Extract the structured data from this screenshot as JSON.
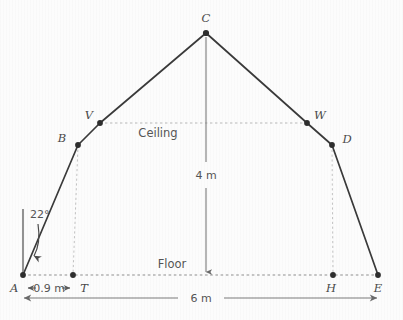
{
  "figure": {
    "background_color": "#fcfcfc",
    "line_color": "#3a3a3a",
    "dotted_color": "#b5b5b5",
    "dimension_color": "#6a6a6a",
    "text_color": "#555555"
  },
  "points": [
    {
      "id": "A",
      "label": "A",
      "x": 23,
      "y": 275,
      "dot": true,
      "label_x": 10,
      "label_y": 292
    },
    {
      "id": "B",
      "label": "B",
      "x": 78,
      "y": 145,
      "dot": true,
      "label_x": 62,
      "label_y": 142
    },
    {
      "id": "V",
      "label": "V",
      "x": 100,
      "y": 123,
      "dot": true,
      "label_x": 87,
      "label_y": 119
    },
    {
      "id": "C",
      "label": "C",
      "x": 206,
      "y": 33,
      "dot": true,
      "label_x": 202,
      "label_y": 22
    },
    {
      "id": "W",
      "label": "W",
      "x": 307,
      "y": 123,
      "dot": true,
      "label_x": 315,
      "label_y": 119
    },
    {
      "id": "D",
      "label": "D",
      "x": 332,
      "y": 145,
      "dot": true,
      "label_x": 342,
      "label_y": 142
    },
    {
      "id": "E",
      "label": "E",
      "x": 378,
      "y": 275,
      "dot": true,
      "label_x": 375,
      "label_y": 292
    },
    {
      "id": "T",
      "label": "T",
      "x": 73,
      "y": 275,
      "dot": true,
      "label_x": 82,
      "label_y": 292
    },
    {
      "id": "H",
      "label": "H",
      "x": 333,
      "y": 275,
      "dot": true,
      "label_x": 329,
      "label_y": 292
    }
  ],
  "solid_outline": {
    "description": "A-B-V-C-W-D-E walls and roof",
    "path": "M 23 275 L 78 145 L 100 123 L 206 33 L 307 123 L 332 145 L 378 275"
  },
  "dotted_lines": [
    {
      "name": "ceiling-line",
      "x1": 100,
      "y1": 123,
      "x2": 307,
      "y2": 123
    },
    {
      "name": "floor-line",
      "x1": 23,
      "y1": 275,
      "x2": 378,
      "y2": 275
    },
    {
      "name": "left-vertical-BT",
      "x1": 78,
      "y1": 145,
      "x2": 73,
      "y2": 275
    },
    {
      "name": "right-vertical-DH",
      "x1": 332,
      "y1": 145,
      "x2": 333,
      "y2": 275
    }
  ],
  "labels": {
    "ceiling": "Ceiling",
    "floor": "Floor"
  },
  "dimensions": [
    {
      "name": "height-4m",
      "text": "4 m",
      "orientation": "vertical",
      "x1": 206,
      "y1": 37,
      "x2": 206,
      "y2": 274,
      "label_x": 206,
      "label_y": 175
    },
    {
      "name": "width-6m",
      "text": "6 m",
      "orientation": "horizontal",
      "x1": 23,
      "y1": 298,
      "x2": 378,
      "y2": 298,
      "label_x": 200,
      "label_y": 302
    },
    {
      "name": "offset-09m",
      "text": "0.9 m",
      "orientation": "horizontal",
      "x1": 27,
      "y1": 288,
      "x2": 70,
      "y2": 288,
      "label_x": 49,
      "label_y": 292
    }
  ],
  "angle": {
    "name": "angle-at-A",
    "text": "22°",
    "label_x": 34,
    "label_y": 218,
    "vertical_ref_line": {
      "x1": 23,
      "y1": 210,
      "x2": 23,
      "y2": 275
    },
    "arrow_path": "M 38 224 Q 40 242 33 258"
  }
}
